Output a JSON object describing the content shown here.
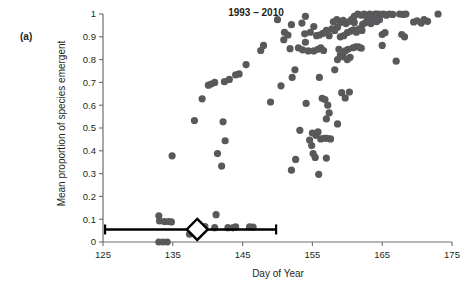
{
  "figure": {
    "panel_label": "(a)",
    "title": "1993 – 2010",
    "xlabel": "Day of Year",
    "ylabel": "Mean proportion of species emergent"
  },
  "colors": {
    "point_fill": "#58595b",
    "axis": "#6d6e71",
    "text": "#231f20",
    "errorbar": "#000000",
    "marker_face": "#ffffff",
    "background": "#ffffff"
  },
  "chart_data": {
    "type": "scatter",
    "title": "1993 – 2010",
    "xlabel": "Day of Year",
    "ylabel": "Mean proportion of species emergent",
    "xlim": [
      125,
      175
    ],
    "ylim": [
      0,
      1
    ],
    "xticks": [
      125,
      135,
      145,
      155,
      165,
      175
    ],
    "xtick_labels": [
      "125",
      "135",
      "145",
      "155",
      "165",
      "175"
    ],
    "yticks": [
      0,
      0.1,
      0.2,
      0.3,
      0.4,
      0.5,
      0.6,
      0.7,
      0.8,
      0.9,
      1
    ],
    "ytick_labels": [
      "0",
      "0.1",
      "0.2",
      "0.3",
      "0.4",
      "0.5",
      "0.6",
      "0.7",
      "0.8",
      "0.9",
      "1"
    ],
    "grid": false,
    "legend": null,
    "marker": "filled-circle",
    "marker_size_px": 7.2,
    "series": [
      {
        "name": "Mean proportion of species emergent",
        "points": [
          [
            133.0,
            0.0
          ],
          [
            133.6,
            0.0
          ],
          [
            134.2,
            0.0
          ],
          [
            133.0,
            0.115
          ],
          [
            133.1,
            0.092
          ],
          [
            133.8,
            0.09
          ],
          [
            134.4,
            0.09
          ],
          [
            134.8,
            0.088
          ],
          [
            134.9,
            0.378
          ],
          [
            137.4,
            0.034
          ],
          [
            137.7,
            0.043
          ],
          [
            138.6,
            0.045
          ],
          [
            139.6,
            0.068
          ],
          [
            141.2,
            0.12
          ],
          [
            141.0,
            0.063
          ],
          [
            142.9,
            0.063
          ],
          [
            143.6,
            0.062
          ],
          [
            144.0,
            0.066
          ],
          [
            146.0,
            0.066
          ],
          [
            146.5,
            0.065
          ],
          [
            138.1,
            0.533
          ],
          [
            139.2,
            0.628
          ],
          [
            140.5,
            0.693
          ],
          [
            141.0,
            0.7
          ],
          [
            140.1,
            0.688
          ],
          [
            142.4,
            0.703
          ],
          [
            143.1,
            0.713
          ],
          [
            144.0,
            0.733
          ],
          [
            144.5,
            0.737
          ],
          [
            145.5,
            0.778
          ],
          [
            142.2,
            0.527
          ],
          [
            142.5,
            0.444
          ],
          [
            141.4,
            0.388
          ],
          [
            142.0,
            0.333
          ],
          [
            148.0,
            0.862
          ],
          [
            150.9,
            0.887
          ],
          [
            147.6,
            0.84
          ],
          [
            149.0,
            0.614
          ],
          [
            150.5,
            0.685
          ],
          [
            152.0,
            0.315
          ],
          [
            152.6,
            0.362
          ],
          [
            153.2,
            0.49
          ],
          [
            152.1,
            0.722
          ],
          [
            152.5,
            0.755
          ],
          [
            151.8,
            0.848
          ],
          [
            153.0,
            0.851
          ],
          [
            153.6,
            0.843
          ],
          [
            154.0,
            0.876
          ],
          [
            154.4,
            0.838
          ],
          [
            153.9,
            0.913
          ],
          [
            154.7,
            0.92
          ],
          [
            155.2,
            0.945
          ],
          [
            155.6,
            0.905
          ],
          [
            154.1,
            0.608
          ],
          [
            154.6,
            0.447
          ],
          [
            154.9,
            0.423
          ],
          [
            155.1,
            0.388
          ],
          [
            155.4,
            0.371
          ],
          [
            155.9,
            0.297
          ],
          [
            155.0,
            0.478
          ],
          [
            155.5,
            0.468
          ],
          [
            155.8,
            0.483
          ],
          [
            156.2,
            0.452
          ],
          [
            156.7,
            0.455
          ],
          [
            157.1,
            0.455
          ],
          [
            157.6,
            0.452
          ],
          [
            156.0,
            0.722
          ],
          [
            156.4,
            0.63
          ],
          [
            156.8,
            0.625
          ],
          [
            157.2,
            0.6
          ],
          [
            157.0,
            0.54
          ],
          [
            157.4,
            0.566
          ],
          [
            157.0,
            0.368
          ],
          [
            155.2,
            0.838
          ],
          [
            155.8,
            0.845
          ],
          [
            156.2,
            0.852
          ],
          [
            156.6,
            0.84
          ],
          [
            156.0,
            0.908
          ],
          [
            156.5,
            0.915
          ],
          [
            157.0,
            0.928
          ],
          [
            157.4,
            0.905
          ],
          [
            157.8,
            0.935
          ],
          [
            158.2,
            0.928
          ],
          [
            158.6,
            0.942
          ],
          [
            158.0,
            0.966
          ],
          [
            158.5,
            0.975
          ],
          [
            159.0,
            0.963
          ],
          [
            159.4,
            0.972
          ],
          [
            159.8,
            0.958
          ],
          [
            160.2,
            0.966
          ],
          [
            160.6,
            0.975
          ],
          [
            161.0,
            0.963
          ],
          [
            158.8,
            0.845
          ],
          [
            159.2,
            0.82
          ],
          [
            159.7,
            0.838
          ],
          [
            160.1,
            0.845
          ],
          [
            159.0,
            0.9
          ],
          [
            159.5,
            0.905
          ],
          [
            160.0,
            0.918
          ],
          [
            160.5,
            0.925
          ],
          [
            160.9,
            0.93
          ],
          [
            161.3,
            0.92
          ],
          [
            161.7,
            0.935
          ],
          [
            162.1,
            0.928
          ],
          [
            161.0,
            0.99
          ],
          [
            161.5,
            1.0
          ],
          [
            162.0,
            0.995
          ],
          [
            162.4,
            1.0
          ],
          [
            162.8,
            0.99
          ],
          [
            163.2,
            1.0
          ],
          [
            163.6,
            0.995
          ],
          [
            164.0,
            1.0
          ],
          [
            158.6,
            0.518
          ],
          [
            159.2,
            0.655
          ],
          [
            159.7,
            0.632
          ],
          [
            160.3,
            0.658
          ],
          [
            158.2,
            0.755
          ],
          [
            158.6,
            0.8
          ],
          [
            159.0,
            0.82
          ],
          [
            159.4,
            0.812
          ],
          [
            160.0,
            0.8
          ],
          [
            160.4,
            0.81
          ],
          [
            160.8,
            0.852
          ],
          [
            161.2,
            0.856
          ],
          [
            161.6,
            0.856
          ],
          [
            162.0,
            0.85
          ],
          [
            162.2,
            0.955
          ],
          [
            162.6,
            0.962
          ],
          [
            163.0,
            0.97
          ],
          [
            163.4,
            0.958
          ],
          [
            163.8,
            0.972
          ],
          [
            164.2,
            0.966
          ],
          [
            164.6,
            0.975
          ],
          [
            164.4,
            1.0
          ],
          [
            164.8,
            0.998
          ],
          [
            165.2,
            1.0
          ],
          [
            165.6,
            0.995
          ],
          [
            166.0,
            1.0
          ],
          [
            166.5,
            0.998
          ],
          [
            165.0,
            0.91
          ],
          [
            165.4,
            0.918
          ],
          [
            165.0,
            0.862
          ],
          [
            167.5,
            1.0
          ],
          [
            168.0,
            0.998
          ],
          [
            168.4,
            1.0
          ],
          [
            167.8,
            0.91
          ],
          [
            168.2,
            0.9
          ],
          [
            167.0,
            0.793
          ],
          [
            169.5,
            0.965
          ],
          [
            170.0,
            0.97
          ],
          [
            170.6,
            0.96
          ],
          [
            171.0,
            0.975
          ],
          [
            171.5,
            0.968
          ],
          [
            173.0,
            1.0
          ],
          [
            150.0,
            0.975
          ],
          [
            151.0,
            0.92
          ],
          [
            151.5,
            0.908
          ],
          [
            153.5,
            0.96
          ],
          [
            154.0,
            0.99
          ],
          [
            152.0,
            0.953
          ]
        ]
      }
    ],
    "summary_marker": {
      "type": "open-diamond",
      "x": 138.5,
      "y": 0.055,
      "label": "mean emergence day"
    },
    "error_bar": {
      "orientation": "horizontal",
      "y": 0.055,
      "x_low": 125.3,
      "x_high": 149.8,
      "cap_style": "vertical-tick"
    }
  }
}
